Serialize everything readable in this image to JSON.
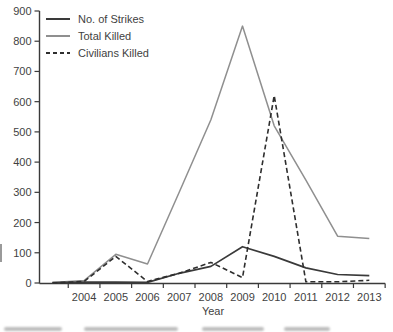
{
  "figure": {
    "background": "#ffffff",
    "axis_color": "#3a3a3a",
    "label_color": "#3f3f3f"
  },
  "chart_data": {
    "type": "line",
    "title": "",
    "xlabel": "Year",
    "ylabel": "",
    "years": [
      2003,
      2004,
      2005,
      2006,
      2007,
      2008,
      2009,
      2010,
      2011,
      2012,
      2013
    ],
    "x_tick_labels": [
      "2004",
      "2005",
      "2006",
      "2007",
      "2008",
      "2009",
      "2010",
      "2011",
      "2012",
      "2013"
    ],
    "first_year_unlabeled": true,
    "y_ticks": [
      0,
      100,
      200,
      300,
      400,
      500,
      600,
      700,
      800,
      900
    ],
    "ylim": [
      0,
      900
    ],
    "grid": false,
    "legend_position": "top-left",
    "series": [
      {
        "name": "No. of Strikes",
        "style": "solid",
        "color": "#3a3a3a",
        "values": [
          1,
          3,
          3,
          2,
          32,
          55,
          120,
          88,
          50,
          28,
          24
        ]
      },
      {
        "name": "Total Killed",
        "style": "solid",
        "color": "#8f8f8f",
        "values": [
          2,
          8,
          95,
          63,
          300,
          540,
          850,
          520,
          340,
          155,
          147
        ]
      },
      {
        "name": "Civilians Killed",
        "style": "dashed",
        "color": "#2e2e2e",
        "values": [
          0,
          5,
          88,
          5,
          32,
          68,
          18,
          620,
          4,
          4,
          9
        ]
      }
    ]
  }
}
